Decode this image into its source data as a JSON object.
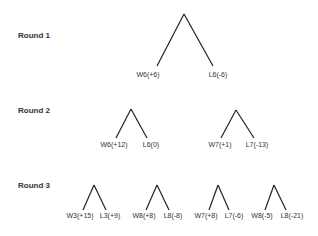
{
  "rounds": [
    {
      "label": "Round 1",
      "trees": [
        {
          "left": "W6(+6)",
          "right": "L6(-6)"
        }
      ]
    },
    {
      "label": "Round 2",
      "trees": [
        {
          "left": "W6(+12)",
          "right": "L6(0)"
        },
        {
          "left": "W7(+1)",
          "right": "L7(-13)"
        }
      ]
    },
    {
      "label": "Round 3",
      "trees": [
        {
          "left": "W3(+15)",
          "right": "L3(+9)"
        },
        {
          "left": "W8(+8)",
          "right": "L8(-8)"
        },
        {
          "left": "W7(+8)",
          "right": "L7(-6)"
        },
        {
          "left": "W8(-5)",
          "right": "L8(-21)"
        }
      ]
    }
  ],
  "colors": {
    "line": "#222222",
    "text": "#333333",
    "background": "#ffffff"
  }
}
